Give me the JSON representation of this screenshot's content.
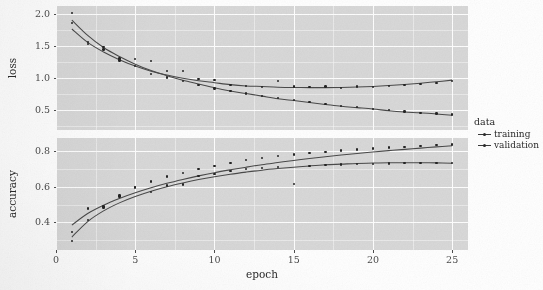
{
  "chart_data": {
    "type": "line",
    "title": "",
    "xlabel": "epoch",
    "x": [
      1,
      2,
      3,
      4,
      5,
      6,
      7,
      8,
      9,
      10,
      11,
      12,
      13,
      14,
      15,
      16,
      17,
      18,
      19,
      20,
      21,
      22,
      23,
      24,
      25
    ],
    "xlim": [
      0,
      26
    ],
    "x_ticks": [
      0,
      5,
      10,
      15,
      20,
      25
    ],
    "x_tick_labels": [
      "0",
      "5",
      "10",
      "15",
      "20",
      "25"
    ],
    "grid": true,
    "legend": {
      "title": "data",
      "position": "right",
      "entries": [
        "training",
        "validation"
      ]
    },
    "facets": [
      {
        "name": "loss",
        "ylabel": "loss",
        "ylim": [
          0.18,
          2.12
        ],
        "y_ticks": [
          0.5,
          1.0,
          1.5,
          2.0
        ],
        "y_tick_labels": [
          "0.5",
          "1.0",
          "1.5",
          "2.0"
        ],
        "series": [
          {
            "name": "training",
            "values": [
              1.85,
              1.56,
              1.44,
              1.27,
              1.18,
              1.06,
              1.0,
              0.95,
              0.88,
              0.83,
              0.79,
              0.75,
              0.71,
              0.68,
              0.65,
              0.62,
              0.59,
              0.56,
              0.54,
              0.51,
              0.49,
              0.47,
              0.45,
              0.44,
              0.42
            ],
            "fit": [
              1.9,
              1.66,
              1.47,
              1.33,
              1.21,
              1.11,
              1.03,
              0.96,
              0.9,
              0.84,
              0.79,
              0.75,
              0.71,
              0.67,
              0.64,
              0.61,
              0.58,
              0.55,
              0.53,
              0.51,
              0.48,
              0.46,
              0.45,
              0.43,
              0.41
            ]
          },
          {
            "name": "validation",
            "values": [
              2.01,
              1.53,
              1.48,
              1.3,
              1.29,
              1.26,
              1.1,
              1.1,
              0.98,
              0.96,
              0.88,
              0.87,
              0.85,
              0.95,
              0.86,
              0.85,
              0.86,
              0.84,
              0.86,
              0.85,
              0.87,
              0.88,
              0.9,
              0.92,
              0.95
            ],
            "fit": [
              1.76,
              1.55,
              1.4,
              1.28,
              1.18,
              1.1,
              1.04,
              0.99,
              0.95,
              0.92,
              0.89,
              0.87,
              0.86,
              0.85,
              0.845,
              0.843,
              0.843,
              0.846,
              0.852,
              0.862,
              0.875,
              0.892,
              0.912,
              0.935,
              0.96
            ]
          }
        ]
      },
      {
        "name": "accuracy",
        "ylabel": "accuracy",
        "ylim": [
          0.245,
          0.875
        ],
        "y_ticks": [
          0.4,
          0.6,
          0.8
        ],
        "y_tick_labels": [
          "0.4",
          "0.6",
          "0.8"
        ],
        "series": [
          {
            "name": "training",
            "values": [
              0.345,
              0.415,
              0.485,
              0.545,
              0.6,
              0.63,
              0.658,
              0.678,
              0.7,
              0.718,
              0.735,
              0.75,
              0.762,
              0.773,
              0.782,
              0.79,
              0.798,
              0.805,
              0.811,
              0.816,
              0.821,
              0.826,
              0.83,
              0.834,
              0.838
            ],
            "fit": [
              0.385,
              0.45,
              0.497,
              0.535,
              0.567,
              0.595,
              0.62,
              0.642,
              0.662,
              0.68,
              0.696,
              0.711,
              0.725,
              0.737,
              0.749,
              0.76,
              0.77,
              0.779,
              0.788,
              0.796,
              0.804,
              0.811,
              0.818,
              0.825,
              0.831
            ]
          },
          {
            "name": "validation",
            "values": [
              0.295,
              0.478,
              0.489,
              0.552,
              0.596,
              0.572,
              0.608,
              0.614,
              0.66,
              0.672,
              0.69,
              0.7,
              0.705,
              0.712,
              0.616,
              0.718,
              0.723,
              0.725,
              0.728,
              0.73,
              0.731,
              0.733,
              0.734,
              0.734,
              0.733
            ],
            "fit": [
              0.318,
              0.405,
              0.465,
              0.51,
              0.546,
              0.576,
              0.601,
              0.622,
              0.641,
              0.657,
              0.671,
              0.683,
              0.694,
              0.703,
              0.711,
              0.718,
              0.724,
              0.728,
              0.732,
              0.734,
              0.736,
              0.736,
              0.736,
              0.735,
              0.733
            ]
          }
        ]
      }
    ]
  },
  "axis": {
    "x_title": "epoch"
  }
}
